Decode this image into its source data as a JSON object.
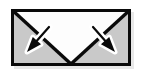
{
  "image": {
    "kind": "icon",
    "semantic_name": "envelope-with-two-arrows-icon",
    "alt_text": "Envelope icon with two arrows pointing outward and downward",
    "width": 142,
    "height": 74,
    "background_color": "#ffffff"
  },
  "colors": {
    "background": "#ffffff",
    "envelope_outline": "#0a0a0a",
    "envelope_body_fill": "#c9c9c9",
    "envelope_flap_fill": "#fdfdfd",
    "arrow_fill": "#0a0a0a",
    "arrow_halo": "#ffffff",
    "shadow": "#e8e8e8"
  },
  "envelope": {
    "name": "envelope-body",
    "label": "Envelope",
    "rect": {
      "x": 11,
      "y": 9,
      "width": 120,
      "height": 57
    },
    "border_width": 3,
    "fill": "#c9c9c9",
    "flap": {
      "name": "envelope-flap",
      "label": "Envelope flap",
      "fill": "#fdfdfd",
      "apex": {
        "x": 71,
        "y": 64
      },
      "left_corner": {
        "x": 14,
        "y": 12
      },
      "right_corner": {
        "x": 128,
        "y": 12
      },
      "crease_width": 3
    }
  },
  "arrows": [
    {
      "name": "arrow-down-left",
      "label": "Arrow pointing down-left",
      "direction": "down-left",
      "tail": {
        "x": 49,
        "y": 27
      },
      "tip": {
        "x": 27,
        "y": 52
      },
      "shaft_width": 2.2,
      "head_length": 15,
      "head_width": 11,
      "fill": "#0a0a0a",
      "halo": "#ffffff",
      "halo_width": 5
    },
    {
      "name": "arrow-down-right",
      "label": "Arrow pointing down-right",
      "direction": "down-right",
      "tail": {
        "x": 93,
        "y": 27
      },
      "tip": {
        "x": 115,
        "y": 52
      },
      "shaft_width": 2.2,
      "head_length": 15,
      "head_width": 11,
      "fill": "#0a0a0a",
      "halo": "#ffffff",
      "halo_width": 5
    }
  ],
  "shadow": {
    "name": "drop-shadow",
    "label": "Drop shadow",
    "offset_x": 3,
    "offset_y": 3,
    "color": "#e8e8e8"
  }
}
